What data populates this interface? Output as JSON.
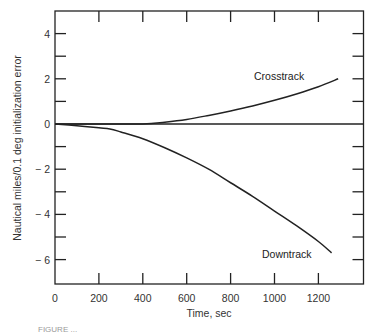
{
  "chart_data": {
    "type": "line",
    "title": "",
    "xlabel": "Time, sec",
    "ylabel": "Nautical miles/0.1 deg initialization error",
    "xlim": [
      0,
      1400
    ],
    "ylim": [
      -7.1,
      5
    ],
    "x_ticks": [
      0,
      200,
      400,
      600,
      800,
      1000,
      1200
    ],
    "x_tick_labels": [
      "0",
      "200",
      "400",
      "600",
      "800",
      "1000",
      "1200"
    ],
    "y_ticks": [
      4,
      2,
      0,
      -2,
      -4,
      -6
    ],
    "y_tick_labels": [
      "4",
      "2",
      "0",
      "− 2",
      "− 4",
      "− 6"
    ],
    "grid": false,
    "reference_line": {
      "y": 0,
      "x_range": [
        0,
        1400
      ]
    },
    "series": [
      {
        "name": "Crosstrack",
        "x": [
          0,
          200,
          400,
          500,
          600,
          700,
          800,
          900,
          1000,
          1100,
          1200,
          1290
        ],
        "values": [
          0,
          0,
          0,
          0.08,
          0.2,
          0.38,
          0.58,
          0.8,
          1.05,
          1.33,
          1.65,
          2.0
        ]
      },
      {
        "name": "Downtrack",
        "x": [
          0,
          100,
          200,
          250,
          300,
          400,
          500,
          600,
          700,
          800,
          900,
          1000,
          1100,
          1200,
          1260
        ],
        "values": [
          0,
          -0.08,
          -0.17,
          -0.22,
          -0.35,
          -0.65,
          -1.05,
          -1.5,
          -2.0,
          -2.6,
          -3.2,
          -3.85,
          -4.5,
          -5.2,
          -5.7
        ]
      }
    ],
    "annotations": [
      {
        "text": "Crosstrack",
        "x": 905,
        "y": 2.1
      },
      {
        "text": "Downtrack",
        "x": 940,
        "y": -5.8
      }
    ],
    "legend": "none (inline labels)"
  },
  "caption": "FIGURE ..."
}
